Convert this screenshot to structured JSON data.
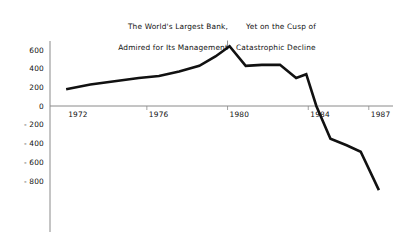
{
  "chart_data": {
    "type": "line",
    "title": "",
    "subtitle": "",
    "xlabel": "",
    "ylabel": "",
    "xlim": [
      1971.2,
      1988.2
    ],
    "ylim": [
      -950,
      700
    ],
    "grid": false,
    "legend": null,
    "x_ticks": [
      "1972",
      "1976",
      "1980",
      "1984",
      "1987"
    ],
    "x_tick_values": [
      1972,
      1976,
      1980,
      1984,
      1987
    ],
    "y_ticks": [
      "600",
      "400",
      "200",
      "0",
      "- 200",
      "- 400",
      "- 600",
      "- 800"
    ],
    "y_tick_values": [
      600,
      400,
      200,
      0,
      -200,
      -400,
      -600,
      -800
    ],
    "series": [
      {
        "name": "Net income",
        "x": [
          1972.0,
          1973.2,
          1974.4,
          1975.6,
          1976.6,
          1977.6,
          1978.6,
          1979.4,
          1980.1,
          1980.9,
          1981.7,
          1982.6,
          1983.4,
          1983.9,
          1984.4,
          1985.1,
          1985.9,
          1986.6,
          1987.5
        ],
        "values": [
          180,
          230,
          265,
          300,
          320,
          370,
          430,
          530,
          640,
          430,
          440,
          440,
          300,
          340,
          0,
          -350,
          -420,
          -490,
          -900
        ]
      }
    ],
    "annotations": [
      {
        "name": "left-caption",
        "line1": "The World's Largest Bank,",
        "line2": "Admired for Its Management",
        "at_x": 1980
      },
      {
        "name": "right-caption",
        "line1": "Yet on the Cusp of",
        "line2": "Catastrophic Decline",
        "at_x": 1980
      }
    ],
    "divider": {
      "name": "peak-marker",
      "x": 1980,
      "from_value": 700,
      "to_value": 610
    },
    "colors": {
      "line": "#111111",
      "axis": "#8a8a8a",
      "text": "#111111",
      "background": "#ffffff"
    }
  }
}
